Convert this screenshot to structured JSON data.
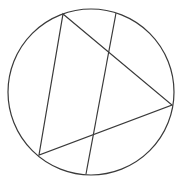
{
  "diagram": {
    "type": "geometry",
    "stroke_color": "#3a3a3a",
    "background": "#ffffff",
    "circle": {
      "cx": 91,
      "cy": 92,
      "r": 83
    },
    "triangle": {
      "vertices": [
        {
          "x": 63,
          "y": 14
        },
        {
          "x": 172,
          "y": 105
        },
        {
          "x": 39,
          "y": 155
        }
      ]
    },
    "chord": {
      "start": {
        "x": 116,
        "y": 13
      },
      "end": {
        "x": 86,
        "y": 174
      }
    }
  }
}
